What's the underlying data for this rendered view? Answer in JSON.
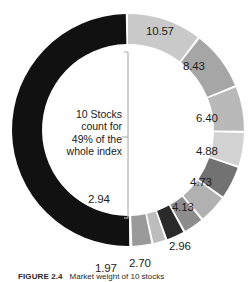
{
  "figure": {
    "caption_number": "FIGURE 2.4",
    "caption_text": "Market weight of 10 stocks"
  },
  "center_note": {
    "line1": "10 Stocks",
    "line2": "count for",
    "line3": "49% of the",
    "line4": "whole index"
  },
  "colors": {
    "background": "#ffffff",
    "text": "#1d1d1d",
    "leader_line": "#b4b4b4",
    "slice_gap": "#ffffff",
    "highlight_black": "#111111"
  },
  "chart_data": {
    "type": "pie",
    "variant": "donut",
    "title": "",
    "subtitle": "",
    "xlabel": "",
    "ylabel": "",
    "grid": false,
    "legend": "none",
    "labels_position": "outside",
    "total_percent": 100,
    "highlight_group_percent": 49,
    "center_cx": 128,
    "center_cy": 130,
    "outer_radius": 116,
    "inner_radius": 86,
    "start_angle_deg": 0,
    "direction": "clockwise",
    "categories": [
      "Stock 1",
      "Stock 2",
      "Stock 3",
      "Stock 4",
      "Stock 5",
      "Stock 6",
      "Stock 7",
      "Stock 8",
      "Stock 9",
      "Stock 10",
      "All other stocks"
    ],
    "values": [
      10.57,
      8.43,
      6.4,
      4.88,
      4.73,
      4.13,
      2.96,
      2.7,
      1.97,
      2.94,
      50.29
    ],
    "slice_colors": [
      "#c9c9c9",
      "#a6a6a6",
      "#b9b9b9",
      "#d2d2d2",
      "#727272",
      "#b1b1b1",
      "#8d8d8d",
      "#2a2a2a",
      "#bdbdbd",
      "#9a9a9a",
      "#111111"
    ],
    "slices": [
      {
        "label": "10.57",
        "value": 10.57,
        "color": "#c9c9c9",
        "label_x": 146,
        "label_y": 25
      },
      {
        "label": "8.43",
        "value": 8.43,
        "color": "#a6a6a6",
        "label_x": 183,
        "label_y": 60
      },
      {
        "label": "6.40",
        "value": 6.4,
        "color": "#b9b9b9",
        "label_x": 196,
        "label_y": 112
      },
      {
        "label": "4.88",
        "value": 4.88,
        "color": "#d2d2d2",
        "label_x": 196,
        "label_y": 145
      },
      {
        "label": "4.73",
        "value": 4.73,
        "color": "#727272",
        "label_x": 190,
        "label_y": 176
      },
      {
        "label": "4.13",
        "value": 4.13,
        "color": "#b1b1b1",
        "label_x": 172,
        "label_y": 201
      },
      {
        "label": "2.96",
        "value": 2.96,
        "color": "#8d8d8d",
        "label_x": 169,
        "label_y": 240
      },
      {
        "label": "2.70",
        "value": 2.7,
        "color": "#2a2a2a",
        "label_x": 129,
        "label_y": 257
      },
      {
        "label": "1.97",
        "value": 1.97,
        "color": "#bdbdbd",
        "label_x": 95,
        "label_y": 262
      },
      {
        "label": "2.94",
        "value": 2.94,
        "color": "#9a9a9a",
        "label_x": 88,
        "label_y": 193
      }
    ]
  }
}
